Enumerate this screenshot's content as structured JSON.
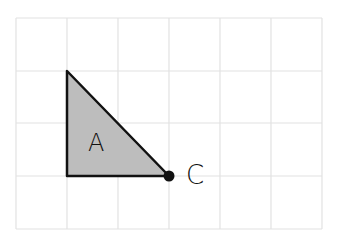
{
  "diagram": {
    "grid": {
      "x_lines": [
        16,
        67,
        118,
        169,
        220,
        271,
        322
      ],
      "y_lines": [
        18,
        71,
        123,
        176,
        229
      ],
      "line_color": "#e2e2e2"
    },
    "shape": {
      "name": "A",
      "type": "right-triangle",
      "vertices": [
        [
          67,
          71
        ],
        [
          67,
          176
        ],
        [
          169,
          176
        ]
      ],
      "fill": "#bdbdbd",
      "stroke": "#111111"
    },
    "point": {
      "name": "C",
      "position": [
        169,
        176
      ],
      "color": "#111111"
    },
    "labels": {
      "shape_label": "A",
      "point_label": "C"
    }
  }
}
